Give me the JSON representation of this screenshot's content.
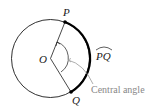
{
  "diagram": {
    "type": "circle-central-angle",
    "center_label": "O",
    "point_labels": {
      "p": "P",
      "q": "Q"
    },
    "arc_label": "PQ",
    "annotation": "Central angle",
    "colors": {
      "circle": "#1a1a1a",
      "arc_highlight": "#000000",
      "annotation_text": "#888888",
      "leader": "#999999"
    }
  }
}
